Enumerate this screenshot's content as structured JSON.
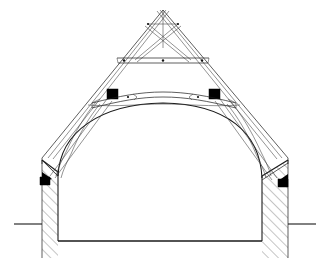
{
  "document": {
    "title": "Timber roof truss cross-section",
    "drawing_type": "architectural-section",
    "description": "Measured cross-section of a gabled building showing a timber roof truss over a barrel-vaulted interior between two hatched masonry walls",
    "background_color": "#ffffff",
    "line_color": "#1a1a1a",
    "hatch_color": "#3d3d3d",
    "solid_fill_color": "#000000",
    "canvas": {
      "width": 328,
      "height": 268
    }
  },
  "geometry": {
    "apex": {
      "x": 163,
      "y": 10
    },
    "ridge_label": "apex",
    "span_left_eave_x": 42,
    "span_right_eave_x": 288,
    "eave_y": 158,
    "floor_y": 241,
    "ground_line_y": 224,
    "wall_inner_left_x": 58,
    "wall_inner_right_x": 262,
    "wall_outer_left_x": 42,
    "wall_outer_right_x": 288
  },
  "elements": {
    "principal_rafters": {
      "name": "Principal rafters",
      "count": 2,
      "note": "Paired double lines running from eaves to apex on both slopes"
    },
    "scissor_braces": {
      "name": "Scissor braces",
      "count": 2,
      "note": "Crossing struts forming an X below the apex"
    },
    "upper_collar": {
      "name": "Upper collar beam",
      "y": 60,
      "left_x": 118,
      "right_x": 208,
      "note": "Horizontal collar with pegged joints at both ends and centre"
    },
    "cambered_tie": {
      "name": "Cambered tie beam",
      "y": 99,
      "left_x": 90,
      "right_x": 237,
      "note": "Slightly arched (cambered) tie beam with lap joints"
    },
    "purlins": {
      "name": "Purlins in section",
      "fill": "#000000",
      "positions": [
        {
          "label": "left-purlin",
          "x": 107,
          "y": 89,
          "w": 11,
          "h": 10
        },
        {
          "label": "right-purlin",
          "x": 209,
          "y": 89,
          "w": 11,
          "h": 10
        }
      ]
    },
    "wall_plates": {
      "name": "Wall plates in section",
      "fill": "#000000",
      "positions": [
        {
          "label": "left-wall-plate",
          "x": 40,
          "y": 176,
          "w": 10,
          "h": 8
        },
        {
          "label": "right-wall-plate",
          "x": 278,
          "y": 178,
          "w": 10,
          "h": 8
        }
      ]
    },
    "arch_braces": {
      "name": "Curved arch braces",
      "count": 2,
      "note": "Long sweeping curved braces descending from the tie beam to the wall tops"
    },
    "vault": {
      "name": "Barrel vault soffit",
      "note": "Broad segmental curve springing from the inner wall faces"
    },
    "walls": {
      "name": "Masonry walls in section",
      "hatch": "45-degree parallel hatching",
      "left": {
        "top_y": 158,
        "bottom_y": 258
      },
      "right": {
        "top_y": 158,
        "bottom_y": 258
      }
    },
    "ground": {
      "name": "External ground line",
      "left_from_x": 14,
      "right_to_x": 316,
      "y": 224
    },
    "floor": {
      "name": "Interior floor line",
      "y": 241,
      "from_x": 58,
      "to_x": 262
    }
  },
  "annotations": {
    "visible_text": [],
    "note": "No lettering, dimensions, scale bar or legend appear in the drawing"
  }
}
